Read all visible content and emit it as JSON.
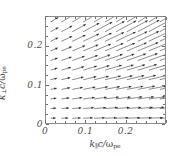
{
  "figure": {
    "background": "#ffffff",
    "frame_color": "#8a8a8a",
    "arrow_color": "#2d2d2d"
  },
  "axes": {
    "x": {
      "title_k": "k",
      "title_sub": "∥",
      "title_tail": "c/",
      "title_omega": "ω",
      "title_omega_sub": "pe",
      "ticks": [
        "0",
        "0.1",
        "0.2"
      ],
      "tick_values": [
        0,
        0.1,
        0.2
      ],
      "range": [
        0,
        0.3
      ]
    },
    "y": {
      "title_k": "k",
      "title_sub": "⊥",
      "title_tail": "c/",
      "title_omega": "ω",
      "title_omega_sub": "pe",
      "ticks": [
        "0",
        "0.1",
        "0.2"
      ],
      "tick_values": [
        0,
        0.1,
        0.2
      ],
      "range": [
        0,
        0.275
      ]
    }
  },
  "chart_data": {
    "type": "scatter",
    "plot_style": "quiver-vector-field",
    "title": "",
    "xlabel": "k_parallel c / omega_pe",
    "ylabel": "k_perp c / omega_pe",
    "xlim": [
      0,
      0.3
    ],
    "ylim": [
      0,
      0.275
    ],
    "xticks": [
      0,
      0.1,
      0.2
    ],
    "yticks": [
      0,
      0.1,
      0.2
    ],
    "grid": false,
    "legend": null,
    "grid_shape": {
      "cols": 11,
      "rows": 11
    },
    "x": [
      0.0125,
      0.04,
      0.0675,
      0.095,
      0.1225,
      0.15,
      0.1775,
      0.205,
      0.2325,
      0.26,
      0.2875
    ],
    "y": [
      0.0125,
      0.0375,
      0.0625,
      0.0875,
      0.1125,
      0.1375,
      0.1625,
      0.1875,
      0.2125,
      0.2375,
      0.2625
    ],
    "vectors": [
      {
        "row": 0,
        "y": 0.0125,
        "angle_deg": 2,
        "lengths": [
          0.012,
          0.016,
          0.02,
          0.023,
          0.026,
          0.028,
          0.03,
          0.032,
          0.034,
          0.035,
          0.036
        ]
      },
      {
        "row": 1,
        "y": 0.0375,
        "angle_deg": 5,
        "lengths": [
          0.013,
          0.018,
          0.022,
          0.026,
          0.029,
          0.031,
          0.033,
          0.035,
          0.037,
          0.038,
          0.039
        ]
      },
      {
        "row": 2,
        "y": 0.0625,
        "angle_deg": 8,
        "lengths": [
          0.014,
          0.019,
          0.024,
          0.028,
          0.031,
          0.034,
          0.036,
          0.038,
          0.04,
          0.041,
          0.042
        ]
      },
      {
        "row": 3,
        "y": 0.0875,
        "angle_deg": 11,
        "lengths": [
          0.015,
          0.021,
          0.026,
          0.03,
          0.034,
          0.037,
          0.039,
          0.041,
          0.043,
          0.044,
          0.045
        ]
      },
      {
        "row": 4,
        "y": 0.1125,
        "angle_deg": 14,
        "lengths": [
          0.016,
          0.022,
          0.028,
          0.033,
          0.037,
          0.04,
          0.042,
          0.044,
          0.046,
          0.047,
          0.048
        ]
      },
      {
        "row": 5,
        "y": 0.1375,
        "angle_deg": 17,
        "lengths": [
          0.017,
          0.024,
          0.03,
          0.035,
          0.039,
          0.043,
          0.045,
          0.047,
          0.049,
          0.05,
          0.051
        ]
      },
      {
        "row": 6,
        "y": 0.1625,
        "angle_deg": 20,
        "lengths": [
          0.018,
          0.026,
          0.032,
          0.038,
          0.042,
          0.046,
          0.048,
          0.05,
          0.052,
          0.053,
          0.054
        ]
      },
      {
        "row": 7,
        "y": 0.1875,
        "angle_deg": 23,
        "lengths": [
          0.019,
          0.027,
          0.034,
          0.04,
          0.045,
          0.049,
          0.051,
          0.053,
          0.055,
          0.056,
          0.057
        ]
      },
      {
        "row": 8,
        "y": 0.2125,
        "angle_deg": 26,
        "lengths": [
          0.02,
          0.029,
          0.036,
          0.043,
          0.048,
          0.052,
          0.054,
          0.056,
          0.058,
          0.059,
          0.06
        ]
      },
      {
        "row": 9,
        "y": 0.2375,
        "angle_deg": 29,
        "lengths": [
          0.021,
          0.03,
          0.038,
          0.045,
          0.051,
          0.055,
          0.057,
          0.059,
          0.061,
          0.062,
          0.063
        ]
      },
      {
        "row": 10,
        "y": 0.2625,
        "angle_deg": 32,
        "lengths": [
          0.022,
          0.032,
          0.04,
          0.048,
          0.054,
          0.058,
          0.06,
          0.062,
          0.064,
          0.065,
          0.066
        ]
      }
    ]
  }
}
